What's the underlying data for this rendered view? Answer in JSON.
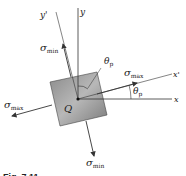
{
  "diagram": {
    "axes": {
      "x": "x",
      "y": "y",
      "x_prime": "x'",
      "y_prime": "y'"
    },
    "origin_label": "Q",
    "angle_label": {
      "symbol": "θ",
      "subscript": "p"
    },
    "stress_labels": {
      "max": {
        "symbol": "σ",
        "subscript": "max"
      },
      "min": {
        "symbol": "σ",
        "subscript": "min"
      }
    },
    "caption": "Fig. 7.11"
  }
}
